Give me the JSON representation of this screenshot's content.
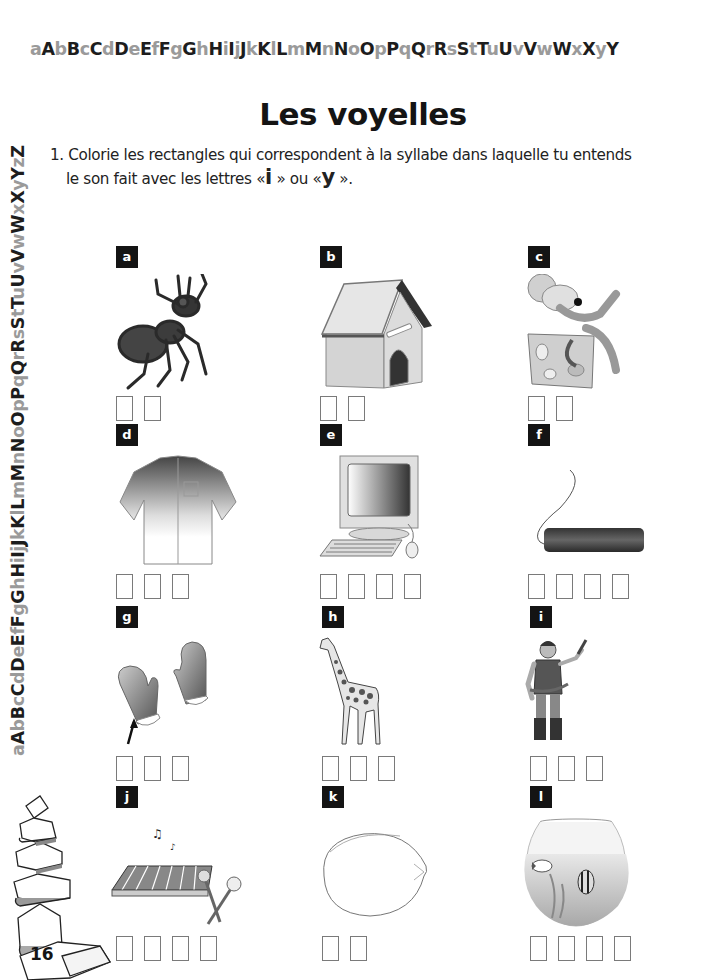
{
  "alphabet": {
    "top": [
      "a",
      "A",
      "b",
      "B",
      "c",
      "C",
      "d",
      "D",
      "e",
      "E",
      "f",
      "F",
      "g",
      "G",
      "h",
      "H",
      "i",
      "I",
      "j",
      "J",
      "k",
      "K",
      "l",
      "L",
      "m",
      "M",
      "n",
      "N",
      "o",
      "O",
      "p",
      "P",
      "q",
      "Q",
      "r",
      "R",
      "s",
      "S",
      "t",
      "T",
      "u",
      "U",
      "v",
      "V",
      "w",
      "W",
      "x",
      "X",
      "y",
      "Y"
    ],
    "side": [
      "a",
      "A",
      "b",
      "B",
      "c",
      "C",
      "d",
      "D",
      "e",
      "E",
      "f",
      "F",
      "g",
      "G",
      "h",
      "H",
      "i",
      "I",
      "j",
      "J",
      "k",
      "K",
      "l",
      "L",
      "m",
      "M",
      "n",
      "N",
      "o",
      "O",
      "p",
      "P",
      "q",
      "Q",
      "r",
      "R",
      "s",
      "S",
      "t",
      "T",
      "u",
      "U",
      "v",
      "V",
      "w",
      "W",
      "x",
      "X",
      "y",
      "Y",
      "z",
      "Z"
    ]
  },
  "page": {
    "title": "Les voyelles",
    "instruction": {
      "number": "1.",
      "line1": "Colorie les rectangles qui correspondent à la syllabe dans laquelle tu entends",
      "line2_prefix": "le son fait avec les lettres «",
      "letter1": "i",
      "middle": "» ou «",
      "letter2": "y",
      "suffix": "»."
    },
    "page_number": "16"
  },
  "items": [
    {
      "label": "a",
      "picture": "ant",
      "boxes": 2
    },
    {
      "label": "b",
      "picture": "doghouse",
      "boxes": 2
    },
    {
      "label": "c",
      "picture": "mouse-on-cheese",
      "boxes": 2
    },
    {
      "label": "d",
      "picture": "shirt",
      "boxes": 3
    },
    {
      "label": "e",
      "picture": "computer",
      "boxes": 4
    },
    {
      "label": "f",
      "picture": "dynamite",
      "boxes": 4
    },
    {
      "label": "g",
      "picture": "mittens",
      "boxes": 3
    },
    {
      "label": "h",
      "picture": "giraffe",
      "boxes": 3
    },
    {
      "label": "i",
      "picture": "pirate",
      "boxes": 3
    },
    {
      "label": "j",
      "picture": "xylophone",
      "boxes": 4
    },
    {
      "label": "k",
      "picture": "lemon",
      "boxes": 2
    },
    {
      "label": "l",
      "picture": "fishbowl",
      "boxes": 4
    }
  ],
  "colors": {
    "dark_letter": "#1d1d1d",
    "light_letter": "#9a9a9a",
    "label_bg": "#141414",
    "box_border": "#7a7a7a"
  }
}
